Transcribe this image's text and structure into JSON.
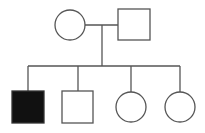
{
  "diagram": {
    "type": "pedigree",
    "colors": {
      "line": "#555555",
      "affected_fill": "#111111",
      "unaffected_fill": "#ffffff"
    },
    "generations": [
      {
        "id": "I",
        "members": [
          {
            "id": "I-1",
            "sex": "female",
            "shape": "circle",
            "affected": false,
            "role": "mother"
          },
          {
            "id": "I-2",
            "sex": "male",
            "shape": "square",
            "affected": false,
            "role": "father"
          }
        ]
      },
      {
        "id": "II",
        "members": [
          {
            "id": "II-1",
            "sex": "male",
            "shape": "square",
            "affected": true
          },
          {
            "id": "II-2",
            "sex": "male",
            "shape": "square",
            "affected": false
          },
          {
            "id": "II-3",
            "sex": "female",
            "shape": "circle",
            "affected": false
          },
          {
            "id": "II-4",
            "sex": "female",
            "shape": "circle",
            "affected": false
          }
        ]
      }
    ],
    "relationships": [
      {
        "type": "marriage",
        "between": [
          "I-1",
          "I-2"
        ]
      },
      {
        "type": "offspring",
        "parents": [
          "I-1",
          "I-2"
        ],
        "children": [
          "II-1",
          "II-2",
          "II-3",
          "II-4"
        ]
      }
    ]
  }
}
